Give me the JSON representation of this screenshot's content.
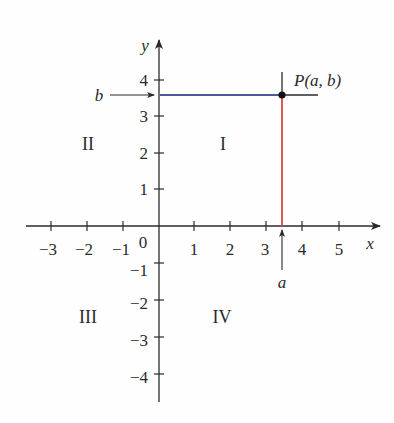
{
  "diagram": {
    "type": "coordinate-plane",
    "axes": {
      "x_label": "x",
      "y_label": "y",
      "origin_label": "0",
      "x_ticks": [
        "−3",
        "−2",
        "−1",
        "1",
        "2",
        "3",
        "4",
        "5"
      ],
      "y_ticks": [
        "4",
        "3",
        "2",
        "1",
        "−1",
        "−2",
        "−3",
        "−4"
      ]
    },
    "quadrants": {
      "I": "I",
      "II": "II",
      "III": "III",
      "IV": "IV"
    },
    "point": {
      "label": "P(a, b)",
      "a_label": "a",
      "b_label": "b",
      "a_value": 3.4,
      "b_value": 3.6
    },
    "colors": {
      "axis": "#2a2a2a",
      "horizontal_projection": "#4a5a9a",
      "vertical_projection": "#d9483b",
      "point": "#111111"
    }
  }
}
